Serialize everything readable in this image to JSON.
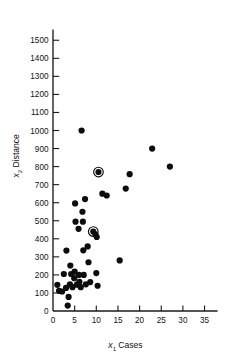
{
  "chart_data": {
    "type": "scatter",
    "title": "",
    "xlabel": "x1 Cases",
    "ylabel": "x2 Distance",
    "xlabel_var": "x",
    "xlabel_sub": "1",
    "xlabel_text": "Cases",
    "ylabel_var": "x",
    "ylabel_sub": "2",
    "ylabel_text": "Distance",
    "xlim": [
      0,
      38
    ],
    "ylim": [
      0,
      1560
    ],
    "xticks": [
      0,
      5,
      10,
      15,
      20,
      25,
      30,
      35
    ],
    "yticks": [
      0,
      100,
      200,
      300,
      400,
      500,
      600,
      700,
      800,
      900,
      1000,
      1100,
      1200,
      1300,
      1400,
      1500
    ],
    "xtick_labels": [
      "0",
      "5",
      "10",
      "15",
      "20",
      "25",
      "30",
      "35"
    ],
    "ytick_labels": [
      "0",
      "100",
      "200",
      "300",
      "400",
      "500",
      "600",
      "700",
      "800",
      "900",
      "1000",
      "1100",
      "1200",
      "1300",
      "1400",
      "1500"
    ],
    "grid": false,
    "legend": false,
    "marker_color": "#0d0d0d",
    "marker_size": 3.1,
    "highlight_ring_radius": 4.8,
    "points": [
      {
        "x": 7,
        "y": 560
      },
      {
        "x": 3,
        "y": 220
      },
      {
        "x": 3,
        "y": 340
      },
      {
        "x": 4,
        "y": 80
      },
      {
        "x": 6,
        "y": 150
      },
      {
        "x": 7,
        "y": 330
      },
      {
        "x": 2,
        "y": 110
      },
      {
        "x": 7,
        "y": 210
      },
      {
        "x": 30,
        "y": 1460
      },
      {
        "x": 5,
        "y": 605
      },
      {
        "x": 16,
        "y": 688
      },
      {
        "x": 10,
        "y": 215
      },
      {
        "x": 4,
        "y": 255
      },
      {
        "x": 6,
        "y": 462
      },
      {
        "x": 9,
        "y": 448
      },
      {
        "x": 10,
        "y": 776
      },
      {
        "x": 6,
        "y": 200
      },
      {
        "x": 7,
        "y": 132
      },
      {
        "x": 3,
        "y": 36
      },
      {
        "x": 17,
        "y": 770
      },
      {
        "x": 10,
        "y": 140
      },
      {
        "x": 26,
        "y": 810
      },
      {
        "x": 9,
        "y": 450
      },
      {
        "x": 8,
        "y": 635
      },
      {
        "x": 4,
        "y": 150
      }
    ],
    "plotted_points": [
      {
        "x": 1.0,
        "y": 145,
        "highlight": false
      },
      {
        "x": 1.4,
        "y": 112,
        "highlight": false
      },
      {
        "x": 2.1,
        "y": 108,
        "highlight": false
      },
      {
        "x": 2.5,
        "y": 205,
        "highlight": false
      },
      {
        "x": 3.0,
        "y": 128,
        "highlight": false
      },
      {
        "x": 3.1,
        "y": 335,
        "highlight": false
      },
      {
        "x": 3.4,
        "y": 30,
        "highlight": false
      },
      {
        "x": 3.6,
        "y": 78,
        "highlight": false
      },
      {
        "x": 3.9,
        "y": 148,
        "highlight": false
      },
      {
        "x": 4.0,
        "y": 252,
        "highlight": false
      },
      {
        "x": 4.2,
        "y": 205,
        "highlight": false
      },
      {
        "x": 4.5,
        "y": 132,
        "highlight": false
      },
      {
        "x": 4.9,
        "y": 182,
        "highlight": false
      },
      {
        "x": 5.0,
        "y": 218,
        "highlight": false
      },
      {
        "x": 5.1,
        "y": 596,
        "highlight": false
      },
      {
        "x": 5.2,
        "y": 495,
        "highlight": false
      },
      {
        "x": 5.5,
        "y": 146,
        "highlight": false
      },
      {
        "x": 5.9,
        "y": 455,
        "highlight": false
      },
      {
        "x": 6.0,
        "y": 200,
        "highlight": false
      },
      {
        "x": 6.1,
        "y": 162,
        "highlight": false
      },
      {
        "x": 6.4,
        "y": 132,
        "highlight": false
      },
      {
        "x": 6.6,
        "y": 1000,
        "highlight": false
      },
      {
        "x": 6.8,
        "y": 550,
        "highlight": false
      },
      {
        "x": 6.9,
        "y": 495,
        "highlight": false
      },
      {
        "x": 7.0,
        "y": 336,
        "highlight": false
      },
      {
        "x": 7.1,
        "y": 200,
        "highlight": false
      },
      {
        "x": 7.4,
        "y": 620,
        "highlight": false
      },
      {
        "x": 7.6,
        "y": 148,
        "highlight": false
      },
      {
        "x": 8.0,
        "y": 358,
        "highlight": false
      },
      {
        "x": 8.2,
        "y": 270,
        "highlight": false
      },
      {
        "x": 8.6,
        "y": 160,
        "highlight": false
      },
      {
        "x": 9.3,
        "y": 440,
        "highlight": true
      },
      {
        "x": 9.8,
        "y": 425,
        "highlight": false
      },
      {
        "x": 10.0,
        "y": 210,
        "highlight": false
      },
      {
        "x": 10.1,
        "y": 410,
        "highlight": false
      },
      {
        "x": 10.3,
        "y": 140,
        "highlight": false
      },
      {
        "x": 10.5,
        "y": 770,
        "highlight": true
      },
      {
        "x": 11.4,
        "y": 650,
        "highlight": false
      },
      {
        "x": 12.4,
        "y": 640,
        "highlight": false
      },
      {
        "x": 15.4,
        "y": 280,
        "highlight": false
      },
      {
        "x": 16.8,
        "y": 678,
        "highlight": false
      },
      {
        "x": 17.7,
        "y": 758,
        "highlight": false
      },
      {
        "x": 22.9,
        "y": 900,
        "highlight": false
      },
      {
        "x": 27.0,
        "y": 800,
        "highlight": false
      }
    ]
  },
  "axes": {
    "x_title_prefix": "x",
    "x_title_sub": "1",
    "x_title_suffix": "Cases",
    "y_title_prefix": "x",
    "y_title_sub": "2",
    "y_title_suffix": "Distance"
  }
}
